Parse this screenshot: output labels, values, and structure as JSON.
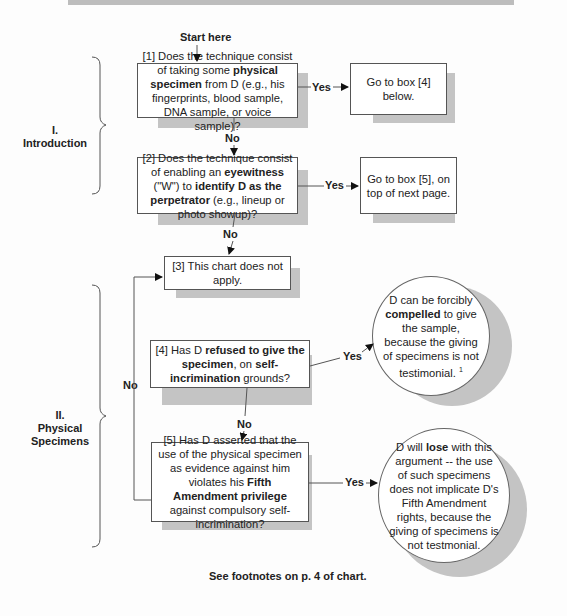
{
  "start_label": "Start here",
  "sections": [
    {
      "numeral": "I.",
      "title": "Introduction"
    },
    {
      "numeral": "II.",
      "title": "Physical Specimens"
    }
  ],
  "boxes": {
    "b1": {
      "pre": "[1] Does the technique consist of taking some ",
      "bold": "physical specimen",
      "post": " from D (e.g., his fingerprints, blood sample, DNA sample, or voice sample)?"
    },
    "b1_yes": "Go to box [4] below.",
    "b2": {
      "pre": "[2] Does the technique consist of enabling an ",
      "bold1": "eyewitness",
      "mid": " (\"W\") to ",
      "bold2": "identify D as the perpetrator",
      "post": " (e.g., lineup or photo showup)?"
    },
    "b2_yes": "Go to box [5], on top of next page.",
    "b3": "[3] This chart does not apply.",
    "b4": {
      "pre": "[4] Has D ",
      "bold1": "refused to give the specimen",
      "mid": ", on ",
      "bold2": "self-incrimination",
      "post": " grounds?"
    },
    "b4_yes": {
      "pre": "D can be forcibly ",
      "bold": "compelled",
      "post": " to give the sample, because the giving of specimens is not testimonial. ",
      "footnote": "1"
    },
    "b5": {
      "pre": "[5] Has D asserted that the use of the physical specimen as evidence against him violates his ",
      "bold": "Fifth Amendment privilege",
      "post": " against compulsory self-incrimination?"
    },
    "b5_yes": {
      "pre": "D will ",
      "bold": "lose",
      "post": " with this argument -- the use of such specimens does not implicate D's Fifth Amendment rights, because the giving of specimens is not testmonial."
    }
  },
  "labels": {
    "yes": "Yes",
    "no": "No"
  },
  "footer": "See footnotes on p. 4 of chart."
}
